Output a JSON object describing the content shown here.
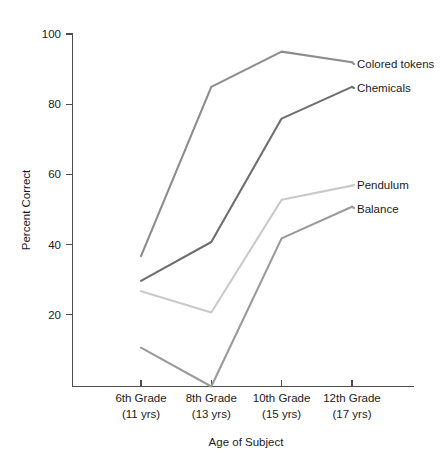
{
  "chart_data": {
    "type": "line",
    "title": "",
    "xlabel": "Age of Subject",
    "ylabel": "Percent Correct",
    "categories": [
      "6th Grade\n(11 yrs)",
      "8th Grade\n(13 yrs)",
      "10th Grade\n(15 yrs)",
      "12th Grade\n(17 yrs)"
    ],
    "category_lines": [
      {
        "grade": "6th Grade",
        "age": "(11 yrs)"
      },
      {
        "grade": "8th Grade",
        "age": "(13 yrs)"
      },
      {
        "grade": "10th Grade",
        "age": "(15 yrs)"
      },
      {
        "grade": "12th Grade",
        "age": "(17 yrs)"
      }
    ],
    "x": [
      1,
      2,
      3,
      4
    ],
    "ylim": [
      0,
      100
    ],
    "yticks": [
      20,
      40,
      60,
      80,
      100
    ],
    "ytick_labels": [
      "20",
      "40",
      "60",
      "80",
      "100"
    ],
    "grid": false,
    "legend_position": "right-inline-labels",
    "series": [
      {
        "name": "Colored tokens",
        "values": [
          37,
          85,
          95,
          92
        ],
        "color": "#8c8c8c"
      },
      {
        "name": "Chemicals",
        "values": [
          30,
          41,
          76,
          85
        ],
        "color": "#6e6e6e"
      },
      {
        "name": "Pendulum",
        "values": [
          27,
          21,
          53,
          57
        ],
        "color": "#c9c9c9"
      },
      {
        "name": "Balance",
        "values": [
          11,
          0,
          42,
          51
        ],
        "color": "#9a9a9a"
      }
    ]
  },
  "axes": {
    "y_title": "Percent Correct",
    "x_title": "Age of Subject",
    "y_ticks": [
      "100",
      "80",
      "60",
      "40",
      "20"
    ]
  },
  "series_labels": {
    "colored_tokens": "Colored tokens",
    "chemicals": "Chemicals",
    "pendulum": "Pendulum",
    "balance": "Balance"
  },
  "x_categories": {
    "c0_grade": "6th Grade",
    "c0_age": "(11 yrs)",
    "c1_grade": "8th Grade",
    "c1_age": "(13 yrs)",
    "c2_grade": "10th Grade",
    "c2_age": "(15 yrs)",
    "c3_grade": "12th Grade",
    "c3_age": "(17 yrs)"
  },
  "colors": {
    "axis": "#4d4d4d",
    "text": "#1a1a1a",
    "background": "#ffffff",
    "colored_tokens": "#8c8c8c",
    "chemicals": "#6e6e6e",
    "pendulum": "#c9c9c9",
    "balance": "#9a9a9a"
  }
}
